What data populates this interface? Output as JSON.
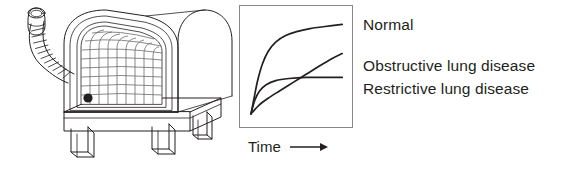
{
  "figure": {
    "background_color": "#ffffff",
    "ink_color": "#231f20",
    "grid_color": "#6d6a6b"
  },
  "spirometer": {
    "name": "spirometer",
    "parts": {
      "mouthpiece": "mouthpiece",
      "tube": "corrugated-breathing-tube",
      "drum": "rotating-recording-drum",
      "chart_paper": "gridded-chart-paper",
      "pen": "recording-pen-marker",
      "base": "instrument-base",
      "legs": "support-legs"
    },
    "grid": {
      "columns": 9,
      "rows": 8
    }
  },
  "chart_data": {
    "type": "line",
    "title": "",
    "xlabel": "Time",
    "ylabel": "",
    "xlim": [
      0,
      100
    ],
    "ylim": [
      0,
      100
    ],
    "grid": false,
    "legend_position": "right",
    "axis_arrow": "⟶",
    "series": [
      {
        "name": "Normal",
        "color": "#231f20",
        "description": "Steep rapid rise to a high plateau",
        "points": [
          [
            0,
            4
          ],
          [
            3,
            18
          ],
          [
            7,
            36
          ],
          [
            12,
            52
          ],
          [
            18,
            64
          ],
          [
            26,
            73
          ],
          [
            36,
            79
          ],
          [
            48,
            83
          ],
          [
            62,
            86
          ],
          [
            78,
            88
          ],
          [
            96,
            90
          ]
        ]
      },
      {
        "name": "Obstructive lung disease",
        "color": "#231f20",
        "description": "Slow shallow rise that keeps climbing gradually",
        "points": [
          [
            0,
            4
          ],
          [
            8,
            12
          ],
          [
            18,
            19
          ],
          [
            30,
            26
          ],
          [
            44,
            34
          ],
          [
            58,
            42
          ],
          [
            72,
            50
          ],
          [
            85,
            57
          ],
          [
            96,
            62
          ]
        ]
      },
      {
        "name": "Restrictive lung disease",
        "color": "#231f20",
        "description": "Rapid rise to a low plateau",
        "points": [
          [
            0,
            4
          ],
          [
            4,
            17
          ],
          [
            9,
            26
          ],
          [
            16,
            32
          ],
          [
            26,
            36
          ],
          [
            40,
            38
          ],
          [
            58,
            39
          ],
          [
            78,
            39
          ],
          [
            96,
            39
          ]
        ]
      }
    ]
  },
  "legend": {
    "items": [
      {
        "label": "Normal"
      },
      {
        "label": "Obstructive lung disease"
      },
      {
        "label": "Restrictive lung disease"
      }
    ]
  }
}
